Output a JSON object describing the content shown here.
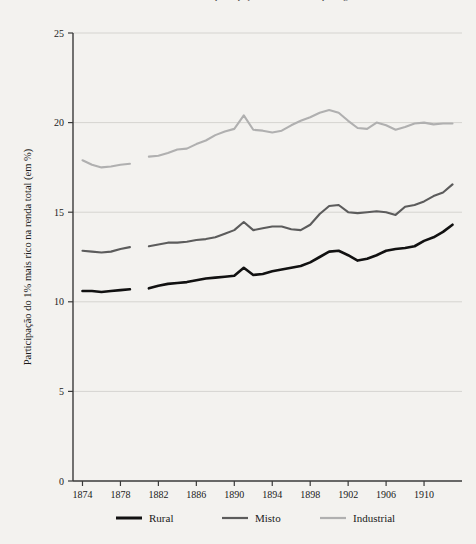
{
  "chart_data": {
    "type": "line",
    "title": "Renda e desenvolvimento: participação do 1% mais rico por região",
    "title_clipped": true,
    "xlabel": "",
    "ylabel": "Participação do 1% mais rico na renda total (em %)",
    "xlim": [
      1873,
      1914
    ],
    "ylim": [
      0,
      25
    ],
    "yticks": [
      0,
      5,
      10,
      15,
      20,
      25
    ],
    "ytick_labels": [
      "0",
      "5",
      "10",
      "15",
      "20",
      "25"
    ],
    "xticks": [
      1874,
      1878,
      1882,
      1886,
      1890,
      1894,
      1898,
      1902,
      1906,
      1910
    ],
    "xtick_labels": [
      "1874",
      "1878",
      "1882",
      "1886",
      "1890",
      "1894",
      "1898",
      "1902",
      "1906",
      "1910"
    ],
    "grid": true,
    "grid_axis": "y",
    "legend_position": "bottom",
    "x": [
      1874,
      1875,
      1876,
      1877,
      1878,
      1879,
      1881,
      1882,
      1883,
      1884,
      1885,
      1886,
      1887,
      1888,
      1889,
      1890,
      1891,
      1892,
      1893,
      1894,
      1895,
      1896,
      1897,
      1898,
      1899,
      1900,
      1901,
      1902,
      1903,
      1904,
      1905,
      1906,
      1907,
      1908,
      1909,
      1910,
      1911,
      1912,
      1913
    ],
    "series": [
      {
        "name": "Rural",
        "color": "#111111",
        "width": 2.6,
        "values": [
          10.6,
          10.6,
          10.55,
          10.6,
          10.65,
          10.7,
          10.75,
          10.9,
          11.0,
          11.05,
          11.1,
          11.2,
          11.3,
          11.35,
          11.4,
          11.45,
          11.9,
          11.5,
          11.55,
          11.7,
          11.8,
          11.9,
          12.0,
          12.2,
          12.5,
          12.8,
          12.85,
          12.6,
          12.3,
          12.4,
          12.6,
          12.85,
          12.95,
          13.0,
          13.1,
          13.4,
          13.6,
          13.9,
          14.3
        ]
      },
      {
        "name": "Misto",
        "color": "#5c5c5c",
        "width": 2.1,
        "values": [
          12.85,
          12.8,
          12.75,
          12.8,
          12.95,
          13.05,
          13.1,
          13.2,
          13.3,
          13.3,
          13.35,
          13.45,
          13.5,
          13.6,
          13.8,
          14.0,
          14.45,
          14.0,
          14.1,
          14.2,
          14.2,
          14.05,
          14.0,
          14.3,
          14.9,
          15.35,
          15.4,
          15.0,
          14.95,
          15.0,
          15.05,
          15.0,
          14.85,
          15.3,
          15.4,
          15.6,
          15.9,
          16.1,
          16.55
        ]
      },
      {
        "name": "Industrial",
        "color": "#b0b0b0",
        "width": 2.1,
        "values": [
          17.9,
          17.65,
          17.5,
          17.55,
          17.65,
          17.7,
          18.1,
          18.15,
          18.3,
          18.5,
          18.55,
          18.8,
          19.0,
          19.3,
          19.5,
          19.65,
          20.4,
          19.6,
          19.55,
          19.45,
          19.55,
          19.85,
          20.1,
          20.3,
          20.55,
          20.7,
          20.55,
          20.1,
          19.7,
          19.65,
          20.0,
          19.85,
          19.6,
          19.75,
          19.95,
          20.0,
          19.9,
          19.95,
          19.95
        ]
      }
    ],
    "gap_after_year": 1879
  },
  "legend": {
    "items": [
      {
        "label": "Rural",
        "color": "#111111"
      },
      {
        "label": "Misto",
        "color": "#5c5c5c"
      },
      {
        "label": "Industrial",
        "color": "#b0b0b0"
      }
    ]
  },
  "colors": {
    "background": "#f3f2ef",
    "axis": "#3a3a3a",
    "grid": "#d5d4d0",
    "text": "#1a1a1a"
  }
}
